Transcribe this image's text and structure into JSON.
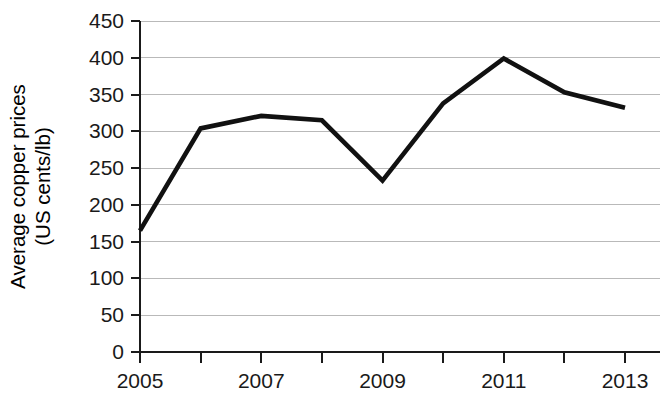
{
  "chart_data": {
    "type": "line",
    "title": "",
    "xlabel": "",
    "ylabel": "Average copper prices (US cents/lb)",
    "ylabel_line1": "Average copper prices",
    "ylabel_line2": "(US cents/lb)",
    "x": [
      2005,
      2006,
      2007,
      2008,
      2009,
      2010,
      2011,
      2012,
      2013
    ],
    "values": [
      165,
      304,
      321,
      315,
      233,
      338,
      399,
      353,
      332
    ],
    "series": [
      {
        "name": "Average copper prices",
        "values": [
          165,
          304,
          321,
          315,
          233,
          338,
          399,
          353,
          332
        ]
      }
    ],
    "xlim": [
      2005,
      2013
    ],
    "ylim": [
      0,
      450
    ],
    "ytick_labels": [
      "0",
      "50",
      "100",
      "150",
      "200",
      "250",
      "300",
      "350",
      "400",
      "450"
    ],
    "ytick_values": [
      0,
      50,
      100,
      150,
      200,
      250,
      300,
      350,
      400,
      450
    ],
    "xtick_values": [
      2005,
      2006,
      2007,
      2008,
      2009,
      2010,
      2011,
      2012,
      2013
    ],
    "xtick_labels": [
      "2005",
      "",
      "2007",
      "",
      "2009",
      "",
      "2011",
      "",
      "2013"
    ],
    "xtick_labels_visible": [
      "2005",
      "2007",
      "2009",
      "2011",
      "2013"
    ],
    "grid": "horizontal",
    "legend": "none",
    "line_color": "#111111",
    "grid_color": "#b9b9b9",
    "axis_color": "#1a1a1a",
    "background_color": "#ffffff"
  }
}
